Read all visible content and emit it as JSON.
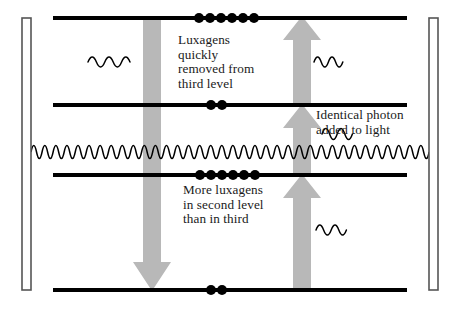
{
  "diagram": {
    "width": 459,
    "height": 309,
    "background_color": "#ffffff",
    "line_color": "#000000",
    "dot_color": "#000000",
    "arrow_color": "#b8b8b8",
    "text_color": "#1a1a1a",
    "mirror_fill": "#ffffff",
    "mirror_stroke": "#555555"
  },
  "captions": {
    "third_level": "Luxagens\nquickly\nremoved from\nthird level",
    "identical_photon": "Identical photon\nadded to light",
    "more_luxagens": "More luxagens\nin second level\nthan in third"
  },
  "levels": [
    {
      "name": "level-4-top",
      "y": 18,
      "dots": 6,
      "dot_center_x": 216
    },
    {
      "name": "level-3-third",
      "y": 105,
      "dots": 2,
      "dot_center_x": 216
    },
    {
      "name": "level-2-second",
      "y": 175,
      "dots": 6,
      "dot_center_x": 222
    },
    {
      "name": "level-1-ground",
      "y": 290,
      "dots": 2,
      "dot_center_x": 216
    }
  ],
  "mirrors": [
    {
      "name": "mirror-left",
      "x": 22,
      "y": 18,
      "width": 9,
      "height": 272
    },
    {
      "name": "mirror-right",
      "x": 429,
      "y": 18,
      "width": 9,
      "height": 272
    }
  ],
  "arrows": {
    "down": {
      "name": "downward-decay-arrow",
      "x": 152,
      "y_from": 18,
      "y_to": 290,
      "width": 18
    },
    "up": [
      {
        "name": "up-arrow-top",
        "x": 302,
        "y_from": 105,
        "y_to": 18,
        "width": 18
      },
      {
        "name": "up-arrow-middle",
        "x": 302,
        "y_from": 175,
        "y_to": 105,
        "width": 18
      },
      {
        "name": "up-arrow-bottom",
        "x": 302,
        "y_from": 290,
        "y_to": 175,
        "width": 18
      }
    ]
  },
  "waves": {
    "cavity_light": {
      "name": "cavity-light-wave",
      "x_start": 31,
      "x_end": 429,
      "y_center": 152,
      "amplitude": 13,
      "cycles": 36
    },
    "photons": [
      {
        "name": "photon-upper-left",
        "x": 88,
        "y": 62,
        "amplitude": 9,
        "cycles": 2.6,
        "length": 44
      },
      {
        "name": "photon-upper-right",
        "x": 314,
        "y": 62,
        "amplitude": 9,
        "cycles": 2.2,
        "length": 32
      },
      {
        "name": "photon-emitted",
        "x": 322,
        "y": 134,
        "amplitude": 10,
        "cycles": 2.2,
        "length": 34
      },
      {
        "name": "photon-lower-right",
        "x": 316,
        "y": 230,
        "amplitude": 9,
        "cycles": 2.2,
        "length": 34
      }
    ]
  }
}
